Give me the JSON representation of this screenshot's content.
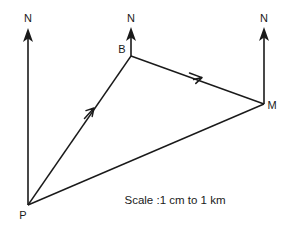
{
  "canvas": {
    "width": 299,
    "height": 228,
    "background_color": "#ffffff",
    "ink_color": "#1a1a1a"
  },
  "caption": {
    "text": "Scale :1 cm to 1 km",
    "x": 175,
    "y": 204
  },
  "vertices": [
    {
      "id": "P",
      "label": "P",
      "x": 28,
      "y": 205,
      "label_x": 23,
      "label_y": 219
    },
    {
      "id": "B",
      "label": "B",
      "x": 131,
      "y": 56,
      "label_x": 120,
      "label_y": 52
    },
    {
      "id": "M",
      "label": "M",
      "x": 264,
      "y": 104,
      "label_x": 269,
      "label_y": 109
    }
  ],
  "north_arrows": [
    {
      "id": "north-at-p",
      "label": "N",
      "x": 28,
      "base_y": 205,
      "tip_y": 30,
      "label_x": 28,
      "label_y": 22
    },
    {
      "id": "north-at-b",
      "label": "N",
      "x": 131,
      "base_y": 56,
      "tip_y": 29,
      "label_x": 131,
      "label_y": 22
    },
    {
      "id": "north-at-m",
      "label": "N",
      "x": 264,
      "base_y": 104,
      "tip_y": 29,
      "label_x": 264,
      "label_y": 22
    }
  ],
  "segments": [
    {
      "id": "segment-p-b",
      "from": "P",
      "to": "B",
      "x1": 28,
      "y1": 205,
      "x2": 131,
      "y2": 56,
      "mid_arrow": true,
      "arrow_x": 90,
      "arrow_y": 112
    },
    {
      "id": "segment-b-m",
      "from": "B",
      "to": "M",
      "x1": 131,
      "y1": 56,
      "x2": 264,
      "y2": 104,
      "mid_arrow": true,
      "arrow_x": 197,
      "arrow_y": 76
    },
    {
      "id": "segment-p-m",
      "from": "P",
      "to": "M",
      "x1": 28,
      "y1": 205,
      "x2": 264,
      "y2": 104,
      "mid_arrow": false,
      "arrow_x": 0,
      "arrow_y": 0
    }
  ]
}
